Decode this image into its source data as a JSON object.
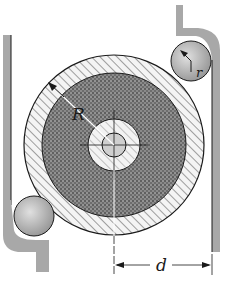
{
  "diagram": {
    "labels": {
      "R": "R",
      "r": "r",
      "d": "d"
    },
    "colors": {
      "ink": "#1a1a1a",
      "wall_fill": "#a8a8a8",
      "roller_fill": "#bdbdbd",
      "disk_fill": "#6e6e6e",
      "ring_fill": "#f2f2f2",
      "background": "#ffffff"
    }
  }
}
